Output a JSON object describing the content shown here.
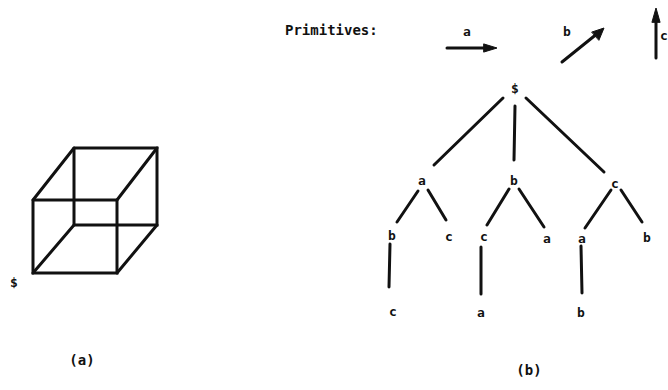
{
  "panel_a": {
    "caption": "(a)",
    "start_label": "$"
  },
  "panel_b": {
    "caption": "(b)",
    "primitives_title": "Primitives:",
    "primitives": [
      {
        "label": "a",
        "direction": "right"
      },
      {
        "label": "b",
        "direction": "diagonal-up-right"
      },
      {
        "label": "c",
        "direction": "up"
      }
    ],
    "tree": {
      "root": "$",
      "level1": [
        "a",
        "b",
        "c"
      ],
      "level2": [
        "b",
        "c",
        "c",
        "a",
        "a",
        "b"
      ],
      "level3": [
        "c",
        "a",
        "b"
      ]
    }
  }
}
